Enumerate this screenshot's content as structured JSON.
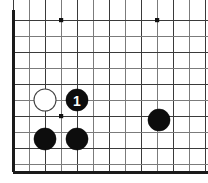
{
  "figure": {
    "kind": "go-board-diagram",
    "width": 208,
    "height": 183,
    "background_color": "#ffffff"
  },
  "board": {
    "origin_x": 13,
    "origin_y": 20,
    "cell_size": 16,
    "columns": 13,
    "rows": 10,
    "line_color": "#7b7b7b",
    "line_color_dark": "#3a3a3a",
    "edge_color": "#1a1a1a",
    "edge_left_x": 13,
    "edge_bottom_y": 172,
    "cropped_edges": [
      "top",
      "right"
    ],
    "star_points": [
      {
        "col": 3,
        "row": 0,
        "x": 61,
        "y": 20
      },
      {
        "col": 9,
        "row": 0,
        "x": 157,
        "y": 20
      },
      {
        "col": 3,
        "row": 6,
        "x": 61,
        "y": 116
      }
    ]
  },
  "stones": [
    {
      "id": "white-stone-1",
      "color": "white",
      "color_hex": "#ffffff",
      "col": 2,
      "row": 5,
      "x": 45,
      "y": 100,
      "radius": 11,
      "label": ""
    },
    {
      "id": "black-stone-move-1",
      "color": "black",
      "color_hex": "#0d0d0d",
      "col": 4,
      "row": 5,
      "x": 77,
      "y": 100,
      "radius": 11,
      "label": "1",
      "label_color": "#ffffff"
    },
    {
      "id": "black-stone-left-lower",
      "color": "black",
      "color_hex": "#0d0d0d",
      "col": 2,
      "row": 7,
      "x": 45,
      "y": 139,
      "radius": 11,
      "label": ""
    },
    {
      "id": "black-stone-center-lower",
      "color": "black",
      "color_hex": "#0d0d0d",
      "col": 4,
      "row": 7,
      "x": 77,
      "y": 139,
      "radius": 11,
      "label": ""
    },
    {
      "id": "black-stone-right",
      "color": "black",
      "color_hex": "#0d0d0d",
      "col": 9,
      "row": 6,
      "x": 159,
      "y": 120,
      "radius": 11,
      "label": ""
    }
  ]
}
